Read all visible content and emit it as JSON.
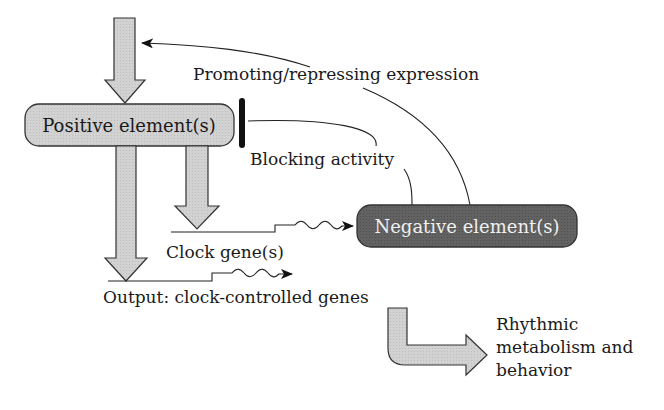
{
  "diagram": {
    "nodes": {
      "positive": {
        "label": "Positive element(s)",
        "fill": "#d4d4d4"
      },
      "negative": {
        "label": "Negative element(s)",
        "fill": "#5e5e5e"
      }
    },
    "labels": {
      "promoting": "Promoting/repressing expression",
      "blocking": "Blocking activity",
      "clock_genes": "Clock gene(s)",
      "output": "Output: clock-controlled genes",
      "rhythmic_1": "Rhythmic",
      "rhythmic_2": "metabolism and",
      "rhythmic_3": "behavior"
    },
    "edges": [
      {
        "from": "input",
        "to": "positive",
        "type": "block-arrow"
      },
      {
        "from": "positive",
        "to": "clock_genes",
        "type": "block-arrow"
      },
      {
        "from": "positive",
        "to": "output_genes",
        "type": "block-arrow"
      },
      {
        "from": "clock_genes",
        "to": "negative",
        "type": "transcription-arrow"
      },
      {
        "from": "output_genes",
        "to": "rhythmic_output",
        "type": "transcription-arrow"
      },
      {
        "from": "negative",
        "to": "positive",
        "type": "inhibition",
        "label": "Blocking activity"
      },
      {
        "from": "negative",
        "to": "input",
        "type": "arrow",
        "label": "Promoting/repressing expression"
      },
      {
        "from": "output_genes",
        "to": "rhythmic_output",
        "type": "bent-block-arrow"
      }
    ],
    "colors": {
      "block_arrow_fill": "#d4d4d4",
      "outline": "#333333",
      "line": "#222222"
    }
  }
}
